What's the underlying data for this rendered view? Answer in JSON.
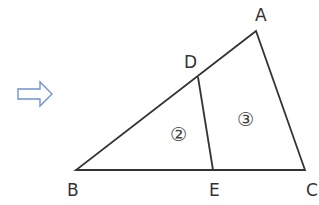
{
  "diagram": {
    "type": "geometry-triangle",
    "arrow": {
      "name": "right-arrow",
      "stroke": "#6f93d2"
    },
    "line_color": "#333333",
    "vertices": {
      "A": {
        "label": "A",
        "x": 256,
        "y": 31
      },
      "B": {
        "label": "B",
        "x": 76,
        "y": 170
      },
      "C": {
        "label": "C",
        "x": 305,
        "y": 170
      },
      "D": {
        "label": "D",
        "x": 198,
        "y": 77
      },
      "E": {
        "label": "E",
        "x": 213,
        "y": 170
      }
    },
    "segments": [
      "AB",
      "BC",
      "CA",
      "DE"
    ],
    "regions": [
      {
        "label": "②",
        "description": "triangle DBE"
      },
      {
        "label": "③",
        "description": "quadrilateral ADEC"
      }
    ]
  }
}
